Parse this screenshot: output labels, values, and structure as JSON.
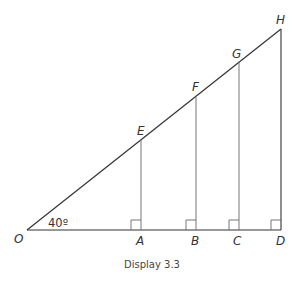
{
  "diagram": {
    "caption": "Display 3.3",
    "angle_label": "40º",
    "points": {
      "O": {
        "label": "O"
      },
      "A": {
        "label": "A"
      },
      "B": {
        "label": "B"
      },
      "C": {
        "label": "C"
      },
      "D": {
        "label": "D"
      },
      "E": {
        "label": "E"
      },
      "F": {
        "label": "F"
      },
      "G": {
        "label": "G"
      },
      "H": {
        "label": "H"
      }
    },
    "segments": [
      "OD",
      "OH",
      "AE",
      "BF",
      "CG",
      "DH"
    ],
    "right_angles": [
      "A",
      "B",
      "C",
      "D"
    ],
    "colors": {
      "line": "#333333",
      "perpendicular": "#666666"
    }
  }
}
